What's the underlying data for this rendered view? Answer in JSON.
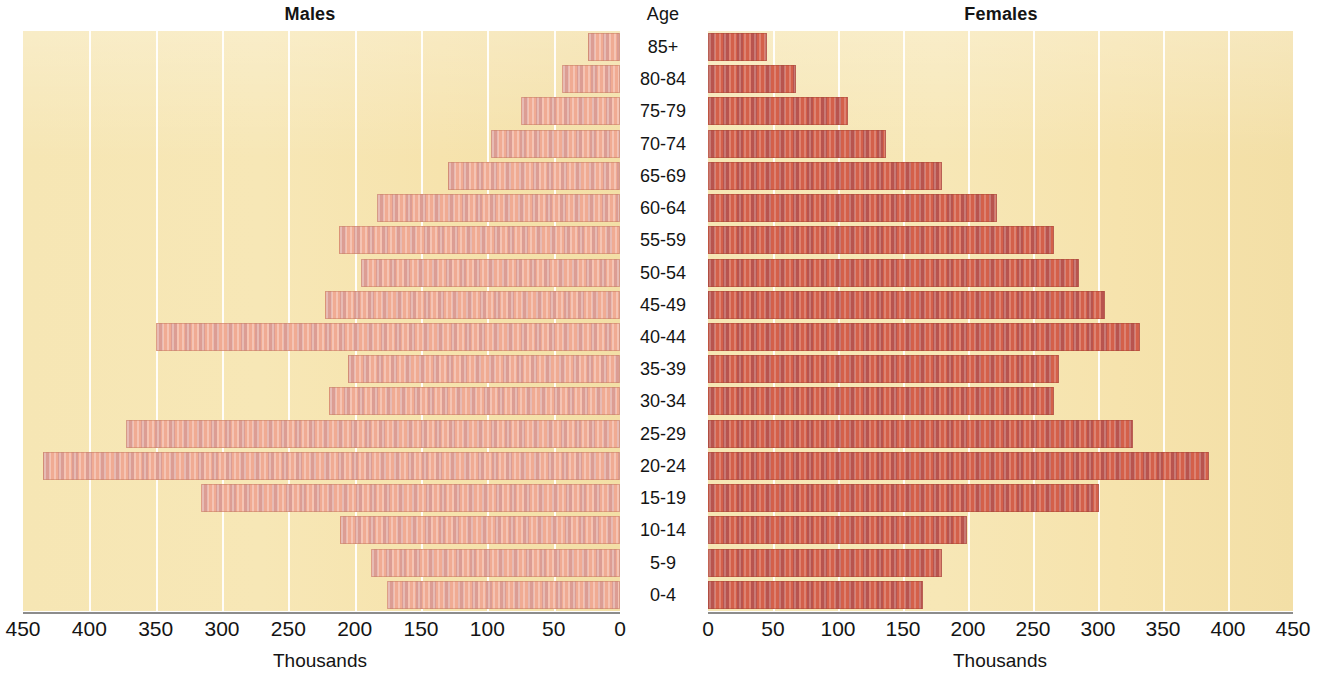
{
  "titles": {
    "males": "Males",
    "age": "Age",
    "females": "Females"
  },
  "axis": {
    "caption_left": "Thousands",
    "caption_right": "Thousands",
    "ticks_left": [
      "450",
      "400",
      "350",
      "300",
      "250",
      "200",
      "150",
      "100",
      "50",
      "0"
    ],
    "ticks_right": [
      "0",
      "50",
      "100",
      "150",
      "200",
      "250",
      "300",
      "350",
      "400",
      "450"
    ]
  },
  "colors": {
    "plot_background": "#f6e6b4",
    "male_bar": "#f0ab93",
    "female_bar": "#d4604a",
    "gridline": "#ffffff",
    "axis_line": "#8c8c8c",
    "text": "#141414"
  },
  "chart_data": {
    "type": "bar",
    "subtype": "population-pyramid",
    "orientation": "horizontal",
    "categories": [
      "85+",
      "80-84",
      "75-79",
      "70-74",
      "65-69",
      "60-64",
      "55-59",
      "50-54",
      "45-49",
      "40-44",
      "35-39",
      "30-34",
      "25-29",
      "20-24",
      "15-19",
      "10-14",
      "5-9",
      "0-4"
    ],
    "series": [
      {
        "name": "Males",
        "side": "left",
        "values": [
          24,
          44,
          75,
          97,
          130,
          183,
          212,
          195,
          222,
          350,
          205,
          219,
          372,
          435,
          316,
          211,
          188,
          176
        ]
      },
      {
        "name": "Females",
        "side": "right",
        "values": [
          45,
          68,
          108,
          137,
          180,
          222,
          266,
          285,
          305,
          332,
          270,
          266,
          327,
          385,
          301,
          199,
          180,
          165
        ]
      }
    ],
    "xlabel": "Thousands",
    "ylabel": "Age",
    "xlim_left": [
      0,
      450
    ],
    "xlim_right": [
      0,
      450
    ],
    "tick_step": 50,
    "grid": true,
    "legend": false,
    "units": "thousands"
  }
}
